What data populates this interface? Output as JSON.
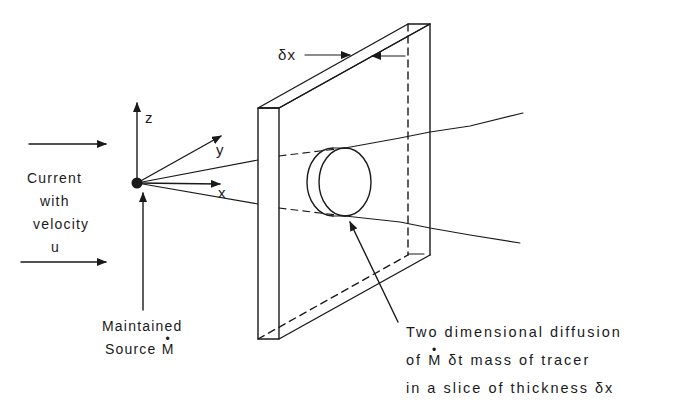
{
  "figure": {
    "axes": {
      "x_label": "x",
      "y_label": "y",
      "z_label": "z"
    },
    "current_label": {
      "line1": "Current",
      "line2": "with",
      "line3": "velocity",
      "line4": "u"
    },
    "source_label": {
      "line1": "Maintained",
      "line2_prefix": "Source ",
      "line2_symbol": "M"
    },
    "slice_thickness_label": "δx",
    "description_label": {
      "line1": "Two dimensional diffusion",
      "line2_prefix": "of ",
      "line2_symbol": "M",
      "line2_suffix": " δt mass of tracer",
      "line3": "in a slice of thickness δx"
    },
    "colors": {
      "ink": "#1a1a1a",
      "background": "#ffffff"
    }
  }
}
